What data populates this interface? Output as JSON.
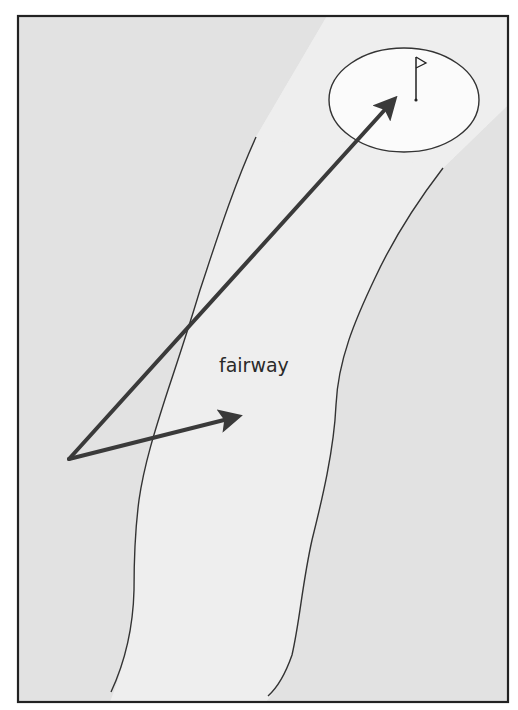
{
  "diagram": {
    "label": "fairway",
    "colors": {
      "page_background": "#ffffff",
      "rough": "#e2e2e2",
      "fairway": "#eeeeee",
      "green": "#fbfbfb",
      "frame": "#222222",
      "outline": "#333333",
      "arrow": "#3a3a3a"
    },
    "elements": {
      "frame": "border",
      "rough": "rough-area",
      "fairway": "fairway-band",
      "green": "putting-green-ellipse",
      "flag": "flag-icon",
      "ball_position": "vertex of two arrows",
      "long_arrow": "shot toward green",
      "short_arrow": "shot toward fairway"
    }
  }
}
